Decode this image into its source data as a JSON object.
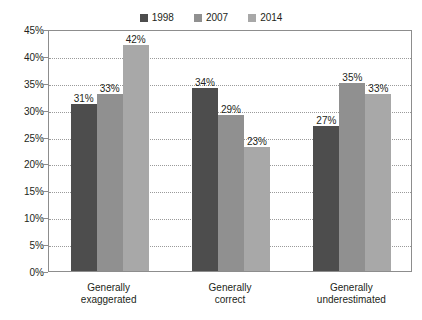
{
  "top_text": "",
  "chart_data": {
    "type": "bar",
    "title": "",
    "subtitle": "",
    "xlabel": "",
    "ylabel": "",
    "categories": [
      "Generally\nexaggerated",
      "Generally\ncorrect",
      "Generally\nunderestimated"
    ],
    "series": [
      {
        "name": "1998",
        "color": "#4d4d4d",
        "values": [
          31,
          33,
          27
        ]
      },
      {
        "name": "2007",
        "color": "#909090",
        "values": [
          33,
          29,
          35
        ]
      },
      {
        "name": "2014",
        "color": "#a8a8a8",
        "values": [
          42,
          23,
          33
        ]
      }
    ],
    "value_labels": [
      [
        "31%",
        "33%",
        "42%"
      ],
      [
        "34%",
        "29%",
        "23%"
      ],
      [
        "27%",
        "35%",
        "33%"
      ]
    ],
    "group_values": [
      [
        31,
        33,
        42
      ],
      [
        34,
        29,
        23
      ],
      [
        27,
        35,
        33
      ]
    ],
    "ylim": [
      0,
      45
    ],
    "ytick_step": 5,
    "ytick_labels": [
      "45%",
      "40%",
      "35%",
      "30%",
      "25%",
      "20%",
      "15%",
      "10%",
      "5%",
      "0%"
    ],
    "ytick_values": [
      45,
      40,
      35,
      30,
      25,
      20,
      15,
      10,
      5,
      0
    ],
    "grid": true,
    "grid_style": "dotted",
    "legend_position": "top-center",
    "legend_entries": [
      "1998",
      "2007",
      "2014"
    ]
  }
}
